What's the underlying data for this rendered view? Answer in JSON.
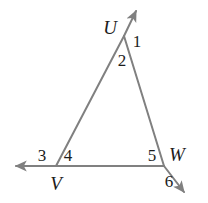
{
  "figure": {
    "kind": "geometry-diagram",
    "width": 208,
    "height": 203,
    "background_color": "#ffffff",
    "line_color": "#808080",
    "text_color": "#1c1c1c",
    "line_width": 2
  },
  "vertices": [
    {
      "id": "U",
      "label": "U",
      "point_x": 124,
      "point_y": 36,
      "label_x": 110,
      "label_y": 27
    },
    {
      "id": "V",
      "label": "V",
      "point_x": 56,
      "point_y": 166,
      "label_x": 56,
      "label_y": 183
    },
    {
      "id": "W",
      "label": "W",
      "point_x": 164,
      "point_y": 166,
      "label_x": 177,
      "label_y": 154
    }
  ],
  "angles": [
    {
      "id": "1",
      "label": "1",
      "label_x": 137,
      "label_y": 41
    },
    {
      "id": "2",
      "label": "2",
      "label_x": 122,
      "label_y": 60
    },
    {
      "id": "3",
      "label": "3",
      "label_x": 42,
      "label_y": 155
    },
    {
      "id": "4",
      "label": "4",
      "label_x": 68,
      "label_y": 155
    },
    {
      "id": "5",
      "label": "5",
      "label_x": 152,
      "label_y": 155
    },
    {
      "id": "6",
      "label": "6",
      "label_x": 169,
      "label_y": 181
    }
  ],
  "segments": [
    {
      "id": "side-UV",
      "x1": 124,
      "y1": 36,
      "x2": 56,
      "y2": 166
    },
    {
      "id": "side-UW",
      "x1": 124,
      "y1": 36,
      "x2": 164,
      "y2": 166
    },
    {
      "id": "side-VW",
      "x1": 56,
      "y1": 166,
      "x2": 164,
      "y2": 166
    }
  ],
  "rays": [
    {
      "id": "ray-U-up",
      "x1": 124,
      "y1": 36,
      "x2": 137,
      "y2": 9,
      "arrow": "end"
    },
    {
      "id": "ray-V-left",
      "x1": 56,
      "y1": 166,
      "x2": 13,
      "y2": 166,
      "arrow": "end"
    },
    {
      "id": "ray-W-down",
      "x1": 164,
      "y1": 166,
      "x2": 186,
      "y2": 195,
      "arrow": "end"
    }
  ]
}
